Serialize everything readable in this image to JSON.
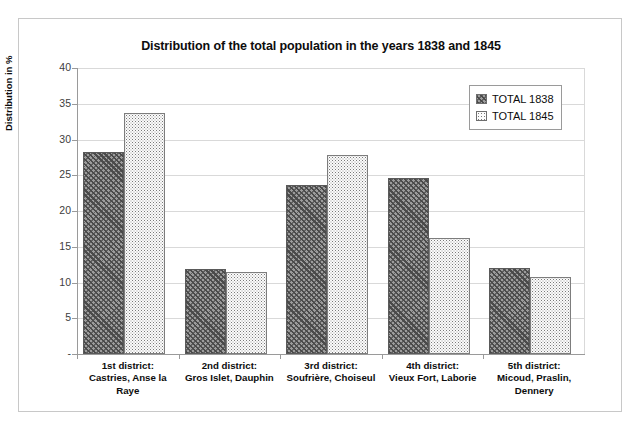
{
  "chart_data": {
    "type": "bar",
    "title": "Distribution of the total population in the years 1838 and 1845",
    "xlabel": "",
    "ylabel": "Distribution in %",
    "ylim": [
      0,
      40
    ],
    "ytick_labels": [
      "40",
      "35",
      "30",
      "25",
      "20",
      "15",
      "10",
      "5",
      "-"
    ],
    "ytick_values": [
      40,
      35,
      30,
      25,
      20,
      15,
      10,
      5,
      0
    ],
    "grid": true,
    "legend_position": "top-right",
    "categories": [
      "1st district:\nCastries, Anse la Raye",
      "2nd district:\nGros Islet, Dauphin",
      "3rd district:\nSoufrière, Choiseul",
      "4th district:\nVieux Fort, Laborie",
      "5th district:\nMicoud, Praslin, Dennery"
    ],
    "category_lines": [
      [
        "1st district:",
        "Castries, Anse la",
        "Raye"
      ],
      [
        "2nd district:",
        "Gros Islet, Dauphin"
      ],
      [
        "3rd district:",
        "Soufrière, Choiseul"
      ],
      [
        "4th district:",
        "Vieux Fort, Laborie"
      ],
      [
        "5th district:",
        "Micoud, Praslin,",
        "Dennery"
      ]
    ],
    "series": [
      {
        "name": "TOTAL 1838",
        "values": [
          28.3,
          11.9,
          23.6,
          24.6,
          12.1
        ]
      },
      {
        "name": "TOTAL 1845",
        "values": [
          33.7,
          11.5,
          27.9,
          16.2,
          10.8
        ]
      }
    ]
  },
  "legend": {
    "items": [
      {
        "label": "TOTAL 1838",
        "swatch": "diagonal-hatch-dark"
      },
      {
        "label": "TOTAL 1845",
        "swatch": "fine-dotted-light"
      }
    ]
  },
  "colors": {
    "series_1838_fill": "#9c9c9c",
    "series_1838_hatch": "#4a4a4a",
    "series_1845_fill": "#fbfbfb",
    "series_1845_dots": "#7a7a7a",
    "gridline": "#d9d9d9",
    "axis": "#9a9a9a",
    "text": "#0d0d0d",
    "frame_border": "#c8c8c8",
    "background": "#ffffff"
  }
}
